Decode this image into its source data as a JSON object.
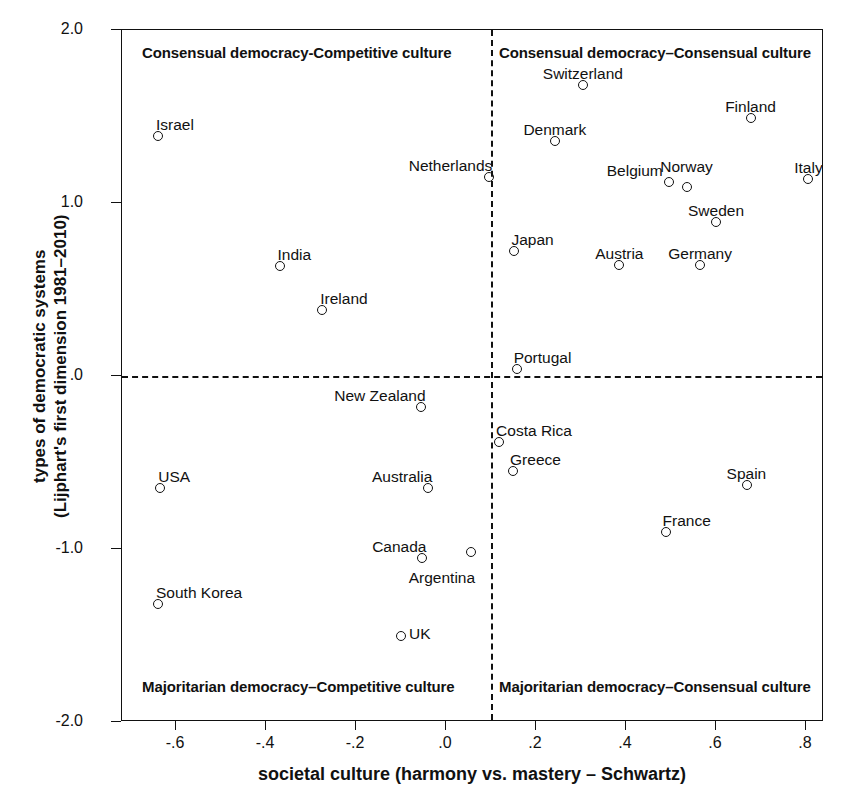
{
  "chart_data": {
    "type": "scatter",
    "title": "",
    "xlabel": "societal culture (harmony vs. mastery – Schwartz)",
    "ylabel": "types of democratic systems\n(Lijphart's first dimension 1981–2010)",
    "ylabel_line1": "types of democratic systems",
    "ylabel_line2": "(Lijphart's first dimension 1981–2010)",
    "xlim": [
      -0.72,
      0.84
    ],
    "ylim": [
      -2.0,
      2.0
    ],
    "xticks": [
      -0.6,
      -0.4,
      -0.2,
      0.0,
      0.2,
      0.4,
      0.6,
      0.8
    ],
    "xticklabels": [
      "-.6",
      "-.4",
      "-.2",
      ".0",
      ".2",
      ".4",
      ".6",
      ".8"
    ],
    "yticks": [
      2.0,
      1.0,
      0.0,
      -1.0,
      -2.0
    ],
    "yticklabels": [
      "2.0",
      "1.0",
      ".0",
      "-1.0",
      "-2.0"
    ],
    "grid": false,
    "legend": "none",
    "reference_lines": [
      {
        "axis": "vertical",
        "value": 0.1,
        "style": "dashed"
      },
      {
        "axis": "horizontal",
        "value": 0.0,
        "style": "dashed"
      }
    ],
    "quadrant_labels": [
      {
        "id": "top-left",
        "text": "Consensual democracy-Competitive culture"
      },
      {
        "id": "top-right",
        "text": "Consensual democracy–Consensual culture"
      },
      {
        "id": "bottom-left",
        "text": "Majoritarian democracy–Competitive culture"
      },
      {
        "id": "bottom-right",
        "text": "Majoritarian democracy–Consensual culture"
      }
    ],
    "points": [
      {
        "label": "Israel",
        "x": -0.64,
        "y": 1.39,
        "label_dx": -2,
        "label_dy": -19,
        "label_align": "left"
      },
      {
        "label": "India",
        "x": -0.37,
        "y": 0.635,
        "label_dx": -2,
        "label_dy": -19,
        "label_align": "left"
      },
      {
        "label": "Ireland",
        "x": -0.275,
        "y": 0.38,
        "label_dx": -2,
        "label_dy": -19,
        "label_align": "left"
      },
      {
        "label": "USA",
        "x": -0.635,
        "y": -0.645,
        "label_dx": -2,
        "label_dy": -19,
        "label_align": "left"
      },
      {
        "label": "South Korea",
        "x": -0.64,
        "y": -1.32,
        "label_dx": -2,
        "label_dy": -19,
        "label_align": "left"
      },
      {
        "label": "New Zealand",
        "x": -0.055,
        "y": -0.18,
        "label_dx": 4,
        "label_dy": -19,
        "label_align": "right"
      },
      {
        "label": "Australia",
        "x": -0.04,
        "y": -0.65,
        "label_dx": 4,
        "label_dy": -19,
        "label_align": "right"
      },
      {
        "label": "Canada",
        "x": -0.053,
        "y": -1.05,
        "label_dx": 4,
        "label_dy": -19,
        "label_align": "right"
      },
      {
        "label": "Argentina",
        "x": 0.055,
        "y": -1.02,
        "label_dx": 4,
        "label_dy": 18,
        "label_align": "right"
      },
      {
        "label": "UK",
        "x": -0.1,
        "y": -1.5,
        "label_dx": 8,
        "label_dy": -10,
        "label_align": "left"
      },
      {
        "label": "Netherlands",
        "x": 0.095,
        "y": 1.15,
        "label_dx": 4,
        "label_dy": -19,
        "label_align": "right"
      },
      {
        "label": "Portugal",
        "x": 0.157,
        "y": 0.04,
        "label_dx": -3,
        "label_dy": -19,
        "label_align": "left"
      },
      {
        "label": "Costa Rica",
        "x": 0.118,
        "y": -0.38,
        "label_dx": -3,
        "label_dy": -19,
        "label_align": "left"
      },
      {
        "label": "Greece",
        "x": 0.149,
        "y": -0.55,
        "label_dx": -3,
        "label_dy": -19,
        "label_align": "left"
      },
      {
        "label": "Japan",
        "x": 0.152,
        "y": 0.72,
        "label_dx": -3,
        "label_dy": -19,
        "label_align": "left"
      },
      {
        "label": "Switzerland",
        "x": 0.304,
        "y": 1.68,
        "label_dx": 0,
        "label_dy": -19,
        "label_align": "center"
      },
      {
        "label": "Denmark",
        "x": 0.242,
        "y": 1.36,
        "label_dx": 0,
        "label_dy": -19,
        "label_align": "center"
      },
      {
        "label": "Austria",
        "x": 0.385,
        "y": 0.64,
        "label_dx": 0,
        "label_dy": -19,
        "label_align": "center"
      },
      {
        "label": "France",
        "x": 0.488,
        "y": -0.9,
        "label_dx": -3,
        "label_dy": -19,
        "label_align": "left"
      },
      {
        "label": "Belgium",
        "x": 0.495,
        "y": 1.12,
        "label_dx": -6,
        "label_dy": -19,
        "label_align": "right"
      },
      {
        "label": "Norway",
        "x": 0.535,
        "y": 1.09,
        "label_dx": 0,
        "label_dy": -28,
        "label_align": "center"
      },
      {
        "label": "Germany",
        "x": 0.565,
        "y": 0.64,
        "label_dx": 0,
        "label_dy": -19,
        "label_align": "center"
      },
      {
        "label": "Sweden",
        "x": 0.6,
        "y": 0.89,
        "label_dx": 0,
        "label_dy": -19,
        "label_align": "center"
      },
      {
        "label": "Spain",
        "x": 0.668,
        "y": -0.63,
        "label_dx": 0,
        "label_dy": -19,
        "label_align": "center"
      },
      {
        "label": "Finland",
        "x": 0.677,
        "y": 1.49,
        "label_dx": 0,
        "label_dy": -19,
        "label_align": "center"
      },
      {
        "label": "Italy",
        "x": 0.805,
        "y": 1.14,
        "label_dx": 0,
        "label_dy": -19,
        "label_align": "center"
      }
    ]
  }
}
